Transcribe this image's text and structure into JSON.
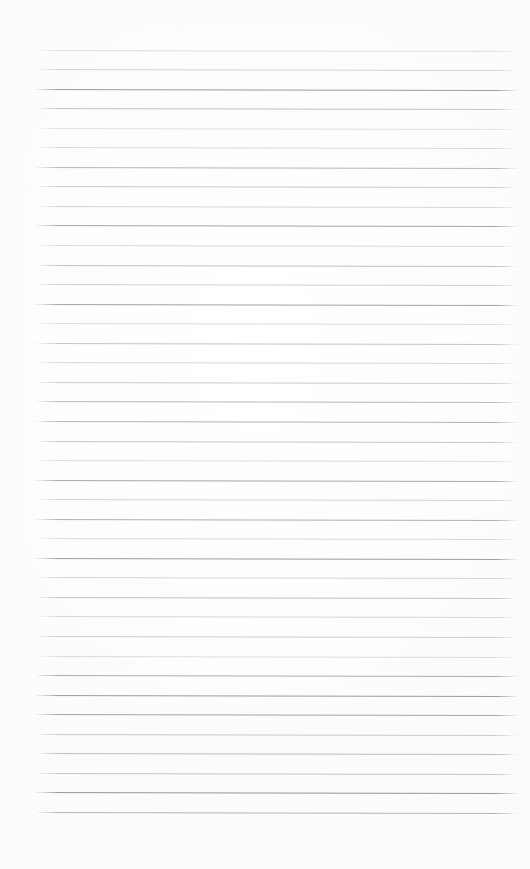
{
  "document": {
    "kind": "scanned-lined-paper",
    "title": "",
    "visible_text": "",
    "note": "blank ruled notebook page scan; no text, headings, numbers or labels are present in the pixels"
  },
  "page": {
    "width": 530,
    "height": 869,
    "background_color": "#ffffff",
    "paper_tone_color": "#fdfdfe",
    "orientation": "portrait"
  },
  "ruling": {
    "line_count": 40,
    "first_line_y": 49.5,
    "line_spacing": 19.55,
    "line_start_x": 33,
    "line_end_x": 521,
    "line_thickness": 1,
    "tilt_degrees": 0.12,
    "dark_line_color": "#9a9aa0",
    "medium_line_color": "#bcbcc2",
    "light_line_color": "#dcdce1",
    "faint_line_color": "#ececf0",
    "lines": [
      {
        "index": 1,
        "y": 49.5,
        "color": "#dedee3",
        "weight": "light"
      },
      {
        "index": 2,
        "y": 69.0,
        "color": "#d2d2d8",
        "weight": "light"
      },
      {
        "index": 3,
        "y": 88.6,
        "color": "#9a9aa0",
        "weight": "dark"
      },
      {
        "index": 4,
        "y": 108.1,
        "color": "#c2c2c8",
        "weight": "medium"
      },
      {
        "index": 5,
        "y": 127.7,
        "color": "#e0e0e5",
        "weight": "faint"
      },
      {
        "index": 6,
        "y": 147.2,
        "color": "#d6d6dc",
        "weight": "light"
      },
      {
        "index": 7,
        "y": 166.8,
        "color": "#b6b6bc",
        "weight": "medium"
      },
      {
        "index": 8,
        "y": 186.3,
        "color": "#c8c8ce",
        "weight": "medium"
      },
      {
        "index": 9,
        "y": 205.9,
        "color": "#d4d4da",
        "weight": "light"
      },
      {
        "index": 10,
        "y": 225.4,
        "color": "#a6a6ac",
        "weight": "dark"
      },
      {
        "index": 11,
        "y": 245.0,
        "color": "#d8d8de",
        "weight": "light"
      },
      {
        "index": 12,
        "y": 264.5,
        "color": "#bebec4",
        "weight": "medium"
      },
      {
        "index": 13,
        "y": 284.1,
        "color": "#d0d0d6",
        "weight": "light"
      },
      {
        "index": 14,
        "y": 303.6,
        "color": "#a2a2a8",
        "weight": "dark"
      },
      {
        "index": 15,
        "y": 323.2,
        "color": "#dadae0",
        "weight": "light"
      },
      {
        "index": 16,
        "y": 342.7,
        "color": "#c4c4ca",
        "weight": "medium"
      },
      {
        "index": 17,
        "y": 362.3,
        "color": "#d6d6dc",
        "weight": "light"
      },
      {
        "index": 18,
        "y": 381.8,
        "color": "#cacad0",
        "weight": "medium"
      },
      {
        "index": 19,
        "y": 401.4,
        "color": "#bababf",
        "weight": "medium"
      },
      {
        "index": 20,
        "y": 420.9,
        "color": "#b2b2b8",
        "weight": "medium"
      },
      {
        "index": 21,
        "y": 440.5,
        "color": "#c6c6cc",
        "weight": "medium"
      },
      {
        "index": 22,
        "y": 460.0,
        "color": "#dcdce1",
        "weight": "light"
      },
      {
        "index": 23,
        "y": 479.6,
        "color": "#a8a8ae",
        "weight": "dark"
      },
      {
        "index": 24,
        "y": 499.1,
        "color": "#d2d2d8",
        "weight": "light"
      },
      {
        "index": 25,
        "y": 518.7,
        "color": "#b0b0b6",
        "weight": "medium"
      },
      {
        "index": 26,
        "y": 538.2,
        "color": "#d8d8de",
        "weight": "light"
      },
      {
        "index": 27,
        "y": 557.8,
        "color": "#9e9ea4",
        "weight": "dark"
      },
      {
        "index": 28,
        "y": 577.3,
        "color": "#d4d4da",
        "weight": "light"
      },
      {
        "index": 29,
        "y": 596.9,
        "color": "#c0c0c6",
        "weight": "medium"
      },
      {
        "index": 30,
        "y": 616.4,
        "color": "#d6d6dc",
        "weight": "light"
      },
      {
        "index": 31,
        "y": 636.0,
        "color": "#cccdd2",
        "weight": "medium"
      },
      {
        "index": 32,
        "y": 655.5,
        "color": "#dadae0",
        "weight": "light"
      },
      {
        "index": 33,
        "y": 675.1,
        "color": "#aaaab0",
        "weight": "dark"
      },
      {
        "index": 34,
        "y": 694.6,
        "color": "#9c9ca2",
        "weight": "dark"
      },
      {
        "index": 35,
        "y": 714.2,
        "color": "#a4a4aa",
        "weight": "dark"
      },
      {
        "index": 36,
        "y": 733.7,
        "color": "#c8c8ce",
        "weight": "medium"
      },
      {
        "index": 37,
        "y": 753.3,
        "color": "#bcbcc2",
        "weight": "medium"
      },
      {
        "index": 38,
        "y": 772.8,
        "color": "#c4c4ca",
        "weight": "medium"
      },
      {
        "index": 39,
        "y": 792.4,
        "color": "#96969c",
        "weight": "dark"
      },
      {
        "index": 40,
        "y": 811.9,
        "color": "#b4b4ba",
        "weight": "medium"
      }
    ]
  },
  "zones": {
    "left_margin_label": "",
    "top_blank_label": "",
    "bottom_blank_label": ""
  }
}
